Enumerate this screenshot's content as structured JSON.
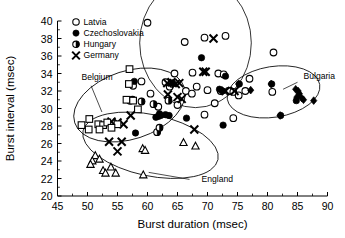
{
  "chart_data": {
    "type": "scatter",
    "title": "",
    "xlabel": "Burst duration (msec)",
    "ylabel": "Burst interval (msec)",
    "xlim": [
      45,
      90
    ],
    "ylim": [
      20,
      40
    ],
    "xticks": [
      45,
      50,
      55,
      60,
      65,
      70,
      75,
      80,
      85,
      90
    ],
    "yticks": [
      20,
      22,
      24,
      26,
      28,
      30,
      32,
      34,
      36,
      38,
      40
    ],
    "xtick_step": 5,
    "ytick_step": 2,
    "grid": false,
    "legend_position": "top-left-inside",
    "legend": [
      {
        "label": "Latvia",
        "marker": "open-circle"
      },
      {
        "label": "Czechoslovakia",
        "marker": "filled-circle"
      },
      {
        "label": "Hungary",
        "marker": "half-filled-circle"
      },
      {
        "label": "Germany",
        "marker": "cross-x"
      }
    ],
    "annotations": [
      {
        "text": "Belgium",
        "x": 49.0,
        "y": 33.3
      },
      {
        "text": "England",
        "x": 69.0,
        "y": 21.6
      },
      {
        "text": "Bulgaria",
        "x": 86.0,
        "y": 33.4
      }
    ],
    "cluster_ellipses": [
      {
        "name": "Belgium",
        "cx": 57.0,
        "cy": 30.4,
        "rx": 9.6,
        "ry": 3.9,
        "rotation": -18
      },
      {
        "name": "England",
        "cx": 60.5,
        "cy": 25.8,
        "rx": 11.5,
        "ry": 3.5,
        "rotation": 12
      },
      {
        "name": "Latvia-group",
        "cx": 68.0,
        "cy": 37.5,
        "rx": 9.3,
        "ry": 7.4,
        "rotation": 0
      },
      {
        "name": "Bulgaria",
        "cx": 81.0,
        "cy": 31.9,
        "rx": 7.8,
        "ry": 2.9,
        "rotation": -9
      }
    ],
    "series": [
      {
        "name": "Latvia",
        "marker": "open-circle",
        "points": [
          [
            60.0,
            39.8
          ],
          [
            66.2,
            37.6
          ],
          [
            69.5,
            38.1
          ],
          [
            73.0,
            38.3
          ],
          [
            64.5,
            34.0
          ],
          [
            67.5,
            34.1
          ],
          [
            71.8,
            34.0
          ],
          [
            72.7,
            33.9
          ],
          [
            70.0,
            32.1
          ],
          [
            66.4,
            32.0
          ],
          [
            67.4,
            31.7
          ],
          [
            68.2,
            32.5
          ],
          [
            72.2,
            32.0
          ],
          [
            73.5,
            32.0
          ],
          [
            74.3,
            31.9
          ],
          [
            75.2,
            31.5
          ],
          [
            77.0,
            33.4
          ],
          [
            81.0,
            36.4
          ],
          [
            80.8,
            31.9
          ],
          [
            71.2,
            30.6
          ],
          [
            65.0,
            30.4
          ],
          [
            60.5,
            31.7
          ],
          [
            61.8,
            30.2
          ],
          [
            69.5,
            29.3
          ],
          [
            74.3,
            28.9
          ],
          [
            57.6,
            32.6
          ],
          [
            59.0,
            33.1
          ],
          [
            63.7,
            32.5
          ],
          [
            76.3,
            32.0
          ],
          [
            63.0,
            33.0
          ]
        ]
      },
      {
        "name": "Czechoslovakia",
        "marker": "filled-circle",
        "points": [
          [
            57.8,
            33.1
          ],
          [
            69.0,
            35.8
          ],
          [
            73.0,
            33.7
          ],
          [
            72.5,
            32.0
          ],
          [
            72.0,
            32.2
          ],
          [
            75.3,
            32.8
          ],
          [
            82.2,
            29.2
          ],
          [
            72.6,
            28.1
          ],
          [
            63.0,
            29.3
          ],
          [
            62.2,
            29.2
          ],
          [
            61.8,
            29.1
          ],
          [
            61.4,
            29.0
          ],
          [
            66.5,
            28.9
          ],
          [
            58.0,
            27.2
          ],
          [
            62.0,
            29.4
          ],
          [
            63.6,
            29.2
          ],
          [
            80.7,
            32.8
          ],
          [
            84.8,
            30.9
          ],
          [
            64.2,
            32.9
          ]
        ]
      },
      {
        "name": "Hungary",
        "marker": "half-filled-circle",
        "points": [
          [
            57.1,
            30.9
          ],
          [
            59.0,
            30.8
          ],
          [
            61.0,
            30.5
          ],
          [
            63.5,
            30.9
          ],
          [
            61.6,
            27.3
          ],
          [
            62.0,
            27.8
          ],
          [
            57.5,
            31.0
          ]
        ]
      },
      {
        "name": "Germany",
        "marker": "cross-x",
        "points": [
          [
            71.0,
            38.0
          ],
          [
            69.3,
            34.2
          ],
          [
            69.7,
            34.2
          ],
          [
            63.3,
            32.9
          ],
          [
            64.0,
            33.0
          ],
          [
            64.7,
            32.8
          ],
          [
            65.3,
            32.9
          ],
          [
            63.4,
            31.6
          ],
          [
            65.0,
            31.3
          ],
          [
            65.7,
            31.1
          ],
          [
            57.2,
            29.2
          ],
          [
            54.0,
            28.5
          ],
          [
            55.0,
            28.4
          ],
          [
            56.0,
            28.2
          ],
          [
            53.6,
            26.2
          ],
          [
            55.7,
            26.2
          ],
          [
            55.0,
            25.1
          ],
          [
            67.8,
            27.6
          ],
          [
            73.0,
            32.0
          ],
          [
            74.5,
            32.0
          ]
        ]
      },
      {
        "name": "Belgium",
        "marker": "open-square",
        "points": [
          [
            57.0,
            34.5
          ],
          [
            56.9,
            32.8
          ],
          [
            56.5,
            31.0
          ],
          [
            57.6,
            30.9
          ],
          [
            58.4,
            29.9
          ],
          [
            49.0,
            28.1
          ],
          [
            50.3,
            28.8
          ],
          [
            50.2,
            27.6
          ],
          [
            51.8,
            28.2
          ],
          [
            52.6,
            28.1
          ],
          [
            53.3,
            28.4
          ],
          [
            55.0,
            28.2
          ],
          [
            54.0,
            27.8
          ],
          [
            52.0,
            27.6
          ]
        ]
      },
      {
        "name": "England",
        "marker": "open-triangle",
        "points": [
          [
            51.3,
            24.6
          ],
          [
            50.8,
            24.0
          ],
          [
            50.5,
            23.6
          ],
          [
            52.0,
            24.2
          ],
          [
            52.6,
            22.9
          ],
          [
            53.0,
            22.6
          ],
          [
            54.7,
            22.6
          ],
          [
            53.9,
            23.3
          ],
          [
            59.3,
            22.4
          ],
          [
            59.2,
            25.4
          ],
          [
            66.0,
            26.1
          ],
          [
            68.0,
            25.7
          ],
          [
            59.6,
            25.2
          ]
        ]
      },
      {
        "name": "Bulgaria",
        "marker": "filled-diamond",
        "points": [
          [
            75.2,
            32.8
          ],
          [
            80.6,
            32.8
          ],
          [
            84.7,
            32.2
          ],
          [
            85.1,
            32.0
          ],
          [
            85.3,
            31.7
          ],
          [
            84.9,
            31.3
          ],
          [
            86.0,
            31.0
          ],
          [
            85.7,
            31.2
          ],
          [
            87.7,
            30.9
          ],
          [
            82.1,
            29.2
          ],
          [
            77.2,
            32.1
          ]
        ]
      }
    ]
  }
}
